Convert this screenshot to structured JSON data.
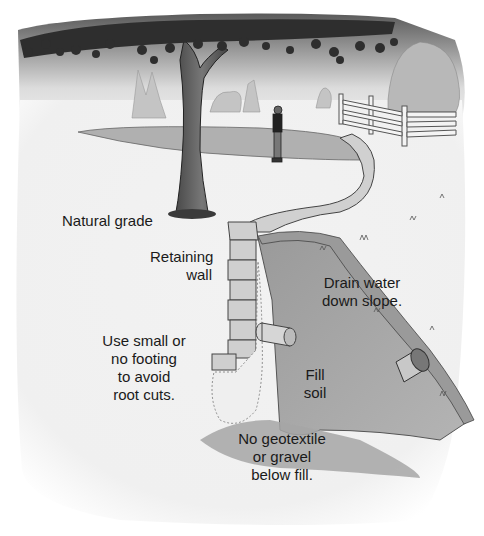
{
  "figure": {
    "labels": {
      "natural_grade": [
        "Natural grade"
      ],
      "retaining_wall": [
        "Retaining",
        "wall"
      ],
      "footing": [
        "Use small or",
        "no footing",
        "to avoid",
        "root cuts."
      ],
      "drain": [
        "Drain water",
        "down slope."
      ],
      "fill": [
        "Fill",
        "soil"
      ],
      "geotextile": [
        "No geotextile",
        "or gravel",
        "below fill."
      ]
    },
    "colors": {
      "sky_dark": "#6e6e6e",
      "sky_light": "#e6e6e6",
      "ground": "#efefef",
      "soil": "#a8a8a8",
      "soil_dark": "#8c8c8c",
      "stone": "#d2d2d2",
      "trunk": "#5a5a5a",
      "leaf": "#2e2e2e",
      "fence": "#f4f4f4"
    }
  }
}
